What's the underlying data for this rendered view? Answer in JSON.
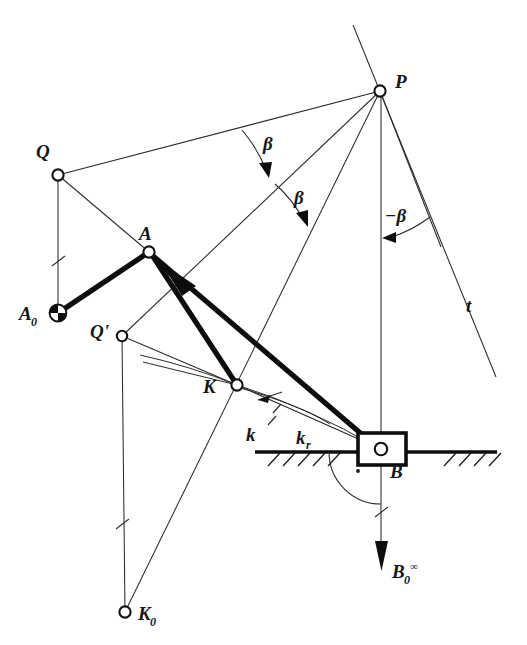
{
  "figure": {
    "type": "kinematic-linkage-diagram",
    "background_color": "#ffffff",
    "line_color": "#1a1a1a",
    "width": 527,
    "height": 645
  },
  "labels": {
    "P": "P",
    "Q": "Q",
    "Q_prime": "Q'",
    "A": "A",
    "A0": "A",
    "A0_sub": "0",
    "K": "K",
    "K0": "K",
    "K0_sub": "0",
    "B": "B",
    "B0": "B",
    "B0_sub": "0",
    "B0_sup": "∞",
    "t": "t",
    "k": "k",
    "kr": "k",
    "kr_sub": "r",
    "beta_1": "β",
    "beta_2": "β",
    "beta_neg": "−β"
  },
  "points": {
    "P": {
      "label": "P",
      "x": 380,
      "y": 91,
      "joint": "open",
      "label_x": 395,
      "label_y": 88
    },
    "Q": {
      "label": "Q",
      "x": 58,
      "y": 175,
      "joint": "open",
      "label_x": 40,
      "label_y": 157
    },
    "Qp": {
      "label": "Q'",
      "x": 122,
      "y": 336,
      "joint": "open",
      "label_x": 95,
      "label_y": 333
    },
    "A": {
      "label": "A",
      "x": 149,
      "y": 252,
      "joint": "open",
      "label_x": 140,
      "label_y": 238
    },
    "A0": {
      "label": "A0",
      "x": 58,
      "y": 313,
      "joint": "fixed",
      "label_x": 20,
      "label_y": 318
    },
    "K": {
      "label": "K",
      "x": 237,
      "y": 385,
      "joint": "open",
      "label_x": 205,
      "label_y": 392
    },
    "K0": {
      "label": "K0",
      "x": 125,
      "y": 612,
      "joint": "open",
      "label_x": 138,
      "label_y": 618
    },
    "B": {
      "label": "B",
      "x": 381,
      "y": 449,
      "joint": "open",
      "label_x": 392,
      "label_y": 476
    }
  },
  "angles": [
    {
      "name": "beta_1",
      "text": "β",
      "label_x": 263,
      "label_y": 148,
      "vertex": "P",
      "sense": "clockwise"
    },
    {
      "name": "beta_2",
      "text": "β",
      "label_x": 295,
      "label_y": 202,
      "vertex": "P",
      "sense": "clockwise"
    },
    {
      "name": "beta_neg",
      "text": "−β",
      "label_x": 388,
      "label_y": 220,
      "vertex": "P",
      "sense": "counterclockwise"
    }
  ],
  "curves": [
    {
      "name": "k",
      "text": "k",
      "label_x": 250,
      "label_y": 440,
      "kind": "path-curvature"
    },
    {
      "name": "k_r",
      "text": "k",
      "sub": "r",
      "label_x": 300,
      "label_y": 444,
      "kind": "path-curvature"
    }
  ],
  "lines": {
    "t": {
      "text": "t",
      "label_x": 467,
      "label_y": 310,
      "kind": "tangent-line"
    }
  },
  "force": {
    "name": "B0_infinity",
    "base": "B",
    "sub": "0",
    "sup": "∞",
    "arrow_tip_x": 382,
    "arrow_tip_y": 570,
    "label_x": 393,
    "label_y": 578
  },
  "ground": {
    "y": 452,
    "x_start": 255,
    "x_end": 497,
    "hatch_count_left": 5,
    "hatch_count_right": 4
  },
  "slider_block": {
    "x": 358,
    "y": 433,
    "width": 48,
    "height": 32
  },
  "right_angle_marker": {
    "dot_x": 358,
    "dot_y": 471,
    "radius": 52
  },
  "tick_marks": [
    {
      "on": "Q-A0",
      "x": 58,
      "y": 261
    },
    {
      "on": "Qp-K0",
      "x": 122,
      "y": 524
    },
    {
      "on": "B-B0",
      "x": 381,
      "y": 512
    }
  ]
}
